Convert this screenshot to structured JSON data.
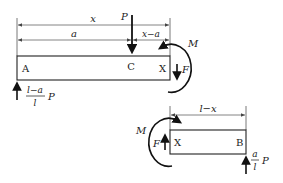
{
  "diagram": {
    "title": "",
    "top_beam": {
      "left_label": "A",
      "load_point_label": "C",
      "cut_label": "X",
      "load": "P",
      "dimensions": {
        "overall": "x",
        "to_load": "a",
        "load_to_cut": "x−a"
      },
      "reaction": {
        "numerator": "l−a",
        "denominator": "l",
        "symbol": "P"
      },
      "shear": "F",
      "moment": "M"
    },
    "bottom_beam": {
      "cut_label": "X",
      "right_label": "B",
      "dimension": "l−x",
      "reaction": {
        "numerator": "a",
        "denominator": "l",
        "symbol": "P"
      },
      "shear": "F",
      "moment": "M"
    }
  }
}
